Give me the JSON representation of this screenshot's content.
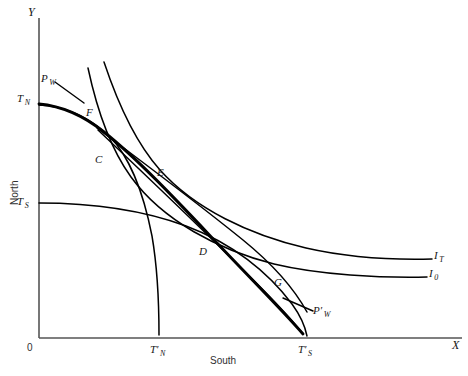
{
  "figure": {
    "type": "economics-offer-curve-diagram",
    "background_color": "#ffffff",
    "line_color": "#000000",
    "axis_color": "#555555"
  },
  "axes": {
    "y_letter": "Y",
    "x_letter": "X",
    "origin_label": "0",
    "y_axis_title": "North",
    "x_axis_title": "South"
  },
  "axis_marks": [
    {
      "key": "T_N",
      "base": "T",
      "sub": "N",
      "prime": ""
    },
    {
      "key": "T_S",
      "base": "T",
      "sub": "S",
      "prime": ""
    },
    {
      "key": "Tp_N",
      "base": "T",
      "sub": "N",
      "prime": "′"
    },
    {
      "key": "Tp_S",
      "base": "T",
      "sub": "S",
      "prime": "′"
    }
  ],
  "price_lines": [
    {
      "key": "P_W",
      "base": "P",
      "sub": "W",
      "prime": ""
    },
    {
      "key": "Pp_W",
      "base": "P",
      "sub": "W",
      "prime": "′"
    }
  ],
  "indifference_curves": [
    {
      "key": "I_T",
      "base": "I",
      "sub": "T",
      "prime": ""
    },
    {
      "key": "I_0",
      "base": "I",
      "sub": "0",
      "prime": ""
    }
  ],
  "points": [
    {
      "key": "F",
      "label": "F"
    },
    {
      "key": "C",
      "label": "C"
    },
    {
      "key": "E",
      "label": "E"
    },
    {
      "key": "D",
      "label": "D"
    },
    {
      "key": "G",
      "label": "G"
    }
  ],
  "labels": {
    "Y": "Y",
    "X": "X",
    "zero": "0",
    "north": "North",
    "south": "South",
    "T_N_base": "T",
    "T_N_sub": "N",
    "T_S_base": "T",
    "T_S_sub": "S",
    "Tp_N_base": "T′",
    "Tp_N_sub": "N",
    "Tp_S_base": "T′",
    "Tp_S_sub": "S",
    "P_W_base": "P",
    "P_W_sub": "W",
    "Pp_W_base": "P′",
    "Pp_W_sub": "W",
    "I_T_base": "I",
    "I_T_sub": "T",
    "I_0_base": "I",
    "I_0_sub": "0",
    "pt_F": "F",
    "pt_C": "C",
    "pt_E": "E",
    "pt_D": "D",
    "pt_G": "G"
  }
}
